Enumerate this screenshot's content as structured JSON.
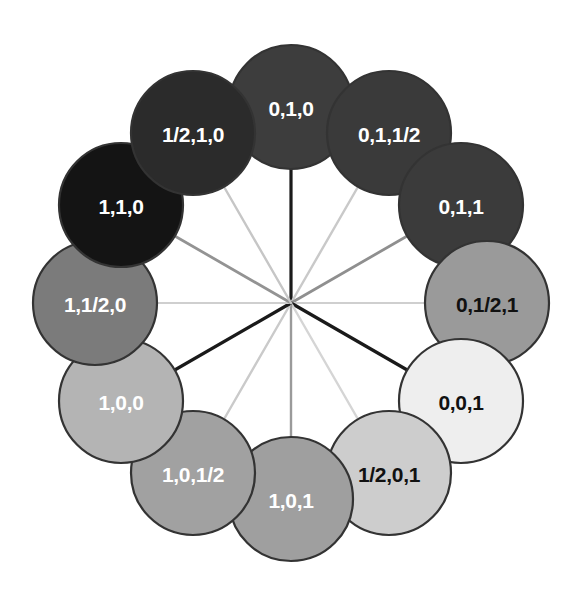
{
  "diagram": {
    "background": "#ffffff",
    "center": {
      "x": 291,
      "y": 303
    },
    "ring_radius": 196,
    "node_radius": 62,
    "node_stroke": "#333333",
    "node_stroke_width": 2.2
  },
  "nodes": [
    {
      "id": "n-0-1-0",
      "label": "0,1,0",
      "angle_deg": -90,
      "fill": "#3d3d3d",
      "text_color": "#ffffff",
      "spoke_color": "#1a1a1a",
      "spoke_width": 3.2,
      "cx": 291,
      "cy": 107
    },
    {
      "id": "n-0-1-half",
      "label": "0,1,1/2",
      "angle_deg": -60,
      "fill": "#3a3a3a",
      "text_color": "#ffffff",
      "spoke_color": "#c9c9c9",
      "spoke_width": 2.4,
      "cx": 389,
      "cy": 133
    },
    {
      "id": "n-0-1-1",
      "label": "0,1,1",
      "angle_deg": -30,
      "fill": "#3b3b3b",
      "text_color": "#ffffff",
      "spoke_color": "#8f8f8f",
      "spoke_width": 2.8,
      "cx": 461,
      "cy": 205
    },
    {
      "id": "n-0-half-1",
      "label": "0,1/2,1",
      "angle_deg": 0,
      "fill": "#9a9a9a",
      "text_color": "#111111",
      "spoke_color": "#cfcfcf",
      "spoke_width": 2.2,
      "cx": 487,
      "cy": 303
    },
    {
      "id": "n-0-0-1",
      "label": "0,0,1",
      "angle_deg": 30,
      "fill": "#eeeeee",
      "text_color": "#111111",
      "spoke_color": "#1a1a1a",
      "spoke_width": 3.2,
      "cx": 461,
      "cy": 401
    },
    {
      "id": "n-half-0-1",
      "label": "1/2,0,1",
      "angle_deg": 60,
      "fill": "#cdcdcd",
      "text_color": "#111111",
      "spoke_color": "#d5d5d5",
      "spoke_width": 2.4,
      "cx": 389,
      "cy": 473
    },
    {
      "id": "n-1-0-1",
      "label": "1,0,1",
      "angle_deg": 90,
      "fill": "#9f9f9f",
      "text_color": "#ffffff",
      "spoke_color": "#9a9a9a",
      "spoke_width": 2.4,
      "cx": 291,
      "cy": 499
    },
    {
      "id": "n-1-0-half",
      "label": "1,0,1/2",
      "angle_deg": 120,
      "fill": "#a1a1a1",
      "text_color": "#ffffff",
      "spoke_color": "#cacaca",
      "spoke_width": 2.4,
      "cx": 193,
      "cy": 473
    },
    {
      "id": "n-1-0-0",
      "label": "1,0,0",
      "angle_deg": 150,
      "fill": "#b4b4b4",
      "text_color": "#ffffff",
      "spoke_color": "#1a1a1a",
      "spoke_width": 3.2,
      "cx": 121,
      "cy": 401
    },
    {
      "id": "n-1-half-0",
      "label": "1,1/2,0",
      "angle_deg": 180,
      "fill": "#7b7b7b",
      "text_color": "#ffffff",
      "spoke_color": "#cfcfcf",
      "spoke_width": 2.2,
      "cx": 95,
      "cy": 303
    },
    {
      "id": "n-1-1-0",
      "label": "1,1,0",
      "angle_deg": -150,
      "fill": "#141414",
      "text_color": "#ffffff",
      "spoke_color": "#939393",
      "spoke_width": 2.8,
      "cx": 121,
      "cy": 205
    },
    {
      "id": "n-half-1-0",
      "label": "1/2,1,0",
      "angle_deg": -120,
      "fill": "#2b2b2b",
      "text_color": "#ffffff",
      "spoke_color": "#c6c6c6",
      "spoke_width": 2.4,
      "cx": 193,
      "cy": 133
    }
  ]
}
